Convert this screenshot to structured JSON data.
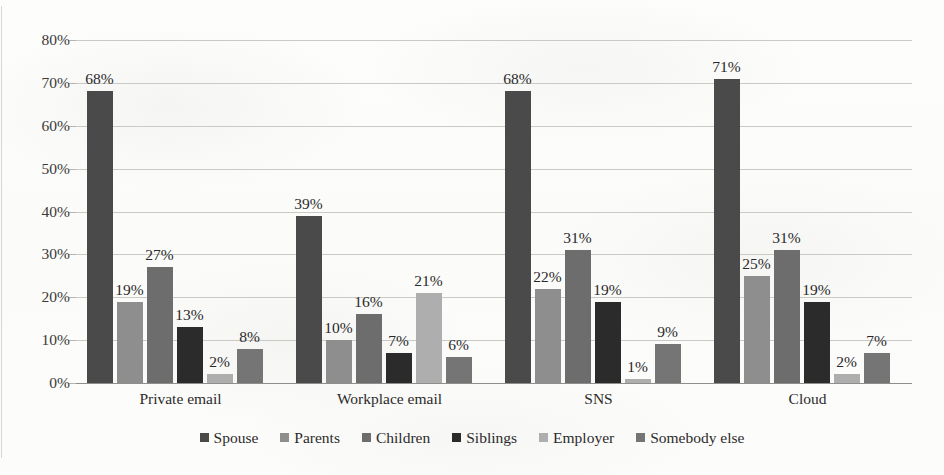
{
  "chart_data": {
    "type": "bar",
    "title": "",
    "subtitle": "",
    "xlabel": "",
    "ylabel": "",
    "ylim": [
      0,
      80
    ],
    "grid": true,
    "legend_position": "bottom",
    "categories": [
      "Private email",
      "Workplace email",
      "SNS",
      "Cloud"
    ],
    "ytick_labels": [
      "80%",
      "70%",
      "60%",
      "50%",
      "40%",
      "30%",
      "20%",
      "10%",
      "0%"
    ],
    "ytick_values": [
      80,
      70,
      60,
      50,
      40,
      30,
      20,
      10,
      0
    ],
    "series": [
      {
        "name": "Spouse",
        "color": "#4a4a4a",
        "values": [
          68,
          39,
          68,
          71
        ],
        "labels": [
          "68%",
          "39%",
          "68%",
          "71%"
        ]
      },
      {
        "name": "Parents",
        "color": "#8e8e8e",
        "values": [
          19,
          10,
          22,
          25
        ],
        "labels": [
          "19%",
          "10%",
          "22%",
          "25%"
        ]
      },
      {
        "name": "Children",
        "color": "#6d6d6d",
        "values": [
          27,
          16,
          31,
          31
        ],
        "labels": [
          "27%",
          "16%",
          "31%",
          "31%"
        ]
      },
      {
        "name": "Siblings",
        "color": "#2b2b2b",
        "values": [
          13,
          7,
          19,
          19
        ],
        "labels": [
          "13%",
          "7%",
          "19%",
          "19%"
        ]
      },
      {
        "name": "Employer",
        "color": "#aeaeae",
        "values": [
          2,
          21,
          1,
          2
        ],
        "labels": [
          "2%",
          "21%",
          "1%",
          "2%"
        ]
      },
      {
        "name": "Somebody else",
        "color": "#757575",
        "values": [
          8,
          6,
          9,
          7
        ],
        "labels": [
          "8%",
          "6%",
          "9%",
          "7%"
        ]
      }
    ]
  },
  "legend": {
    "items": [
      {
        "label": "Spouse"
      },
      {
        "label": "Parents"
      },
      {
        "label": "Children"
      },
      {
        "label": "Siblings"
      },
      {
        "label": "Employer"
      },
      {
        "label": "Somebody else"
      }
    ]
  },
  "background_ghost_text": [
    "",
    "",
    "",
    "",
    "",
    ""
  ]
}
